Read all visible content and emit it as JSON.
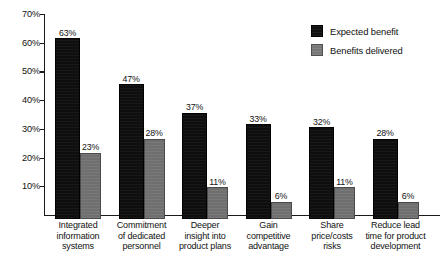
{
  "chart_data": {
    "type": "bar",
    "title": "",
    "subtitle": "",
    "xlabel": "",
    "ylabel": "",
    "grid": false,
    "legend_position": "top-right",
    "ylim": [
      0,
      72
    ],
    "yticks": [
      "10%",
      "20%",
      "30%",
      "40%",
      "50%",
      "60%",
      "70%"
    ],
    "ytick_values": [
      10,
      20,
      30,
      40,
      50,
      60,
      70
    ],
    "categories": [
      "Integrated information systems",
      "Commitment of dedicated personnel",
      "Deeper insight into product plans",
      "Gain competitive advantage",
      "Share price/costs risks",
      "Reduce lead time for product development"
    ],
    "category_lines": [
      [
        "Integrated",
        "information",
        "systems"
      ],
      [
        "Commitment",
        "of dedicated",
        "personnel"
      ],
      [
        "Deeper",
        "insight into",
        "product plans"
      ],
      [
        "Gain",
        "competitive",
        "advantage"
      ],
      [
        "Share",
        "price/costs",
        "risks"
      ],
      [
        "Reduce lead",
        "time for product",
        "development"
      ]
    ],
    "series": [
      {
        "name": "Expected benefit",
        "color": "#0e0e0e",
        "values": [
          63,
          47,
          37,
          33,
          32,
          28
        ],
        "labels": [
          "63%",
          "47%",
          "37%",
          "33%",
          "32%",
          "28%"
        ]
      },
      {
        "name": "Benefits delivered",
        "color": "#6f6f6f",
        "values": [
          23,
          28,
          11,
          6,
          11,
          6
        ],
        "labels": [
          "23%",
          "28%",
          "11%",
          "6%",
          "11%",
          "6%"
        ]
      }
    ]
  },
  "legend": {
    "items": [
      {
        "label": "Expected benefit",
        "swatch": "black"
      },
      {
        "label": "Benefits delivered",
        "swatch": "gray"
      }
    ]
  },
  "caption": {
    "text": ""
  }
}
